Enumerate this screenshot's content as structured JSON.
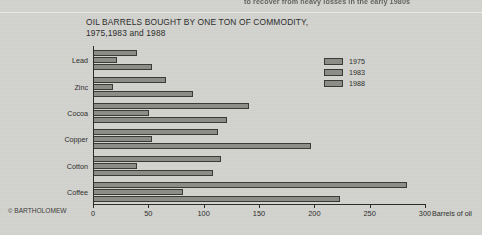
{
  "page": {
    "top_running_text": "to recover from heavy losses in the early 1980s",
    "credit_symbol": "©",
    "credit": "BARTHOLOMEW"
  },
  "chart_data": {
    "type": "bar",
    "orientation": "horizontal",
    "title": "OIL BARRELS BOUGHT BY ONE TON OF COMMODITY,",
    "subtitle": "1975,1983 and 1988",
    "xlabel": "Barrels of oil",
    "ylabel": "",
    "xlim": [
      0,
      300
    ],
    "xticks": [
      0,
      50,
      100,
      150,
      200,
      250,
      300
    ],
    "xtick_labels": [
      "0",
      "50",
      "100",
      "150",
      "200",
      "250",
      "300"
    ],
    "grid": false,
    "legend_position": "top-right",
    "bar_fill": "#8d8d88",
    "bar_stroke": "#3a3a38",
    "categories": [
      "Lead",
      "Zinc",
      "Cocoa",
      "Copper",
      "Cotton",
      "Coffee"
    ],
    "series": [
      {
        "name": "1975",
        "values": [
          40,
          66,
          141,
          113,
          116,
          284
        ]
      },
      {
        "name": "1983",
        "values": [
          22,
          18,
          51,
          53,
          40,
          81
        ]
      },
      {
        "name": "1988",
        "values": [
          53,
          90,
          121,
          197,
          108,
          223
        ]
      }
    ]
  }
}
